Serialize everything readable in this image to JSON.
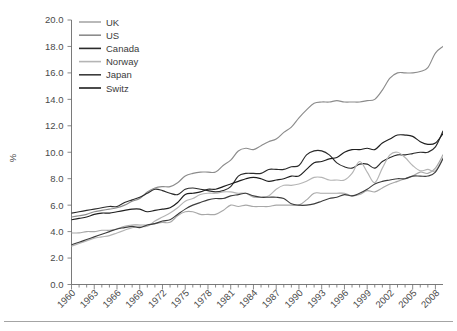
{
  "chart_data": {
    "type": "line",
    "title": "",
    "xlabel": "",
    "ylabel": "%",
    "ylim": [
      0.0,
      20.0
    ],
    "ytick_step": 2.0,
    "xlim": [
      1960,
      2009
    ],
    "grid": false,
    "legend_position": "top-left",
    "ytick_labels": [
      "0.0",
      "2.0",
      "4.0",
      "6.0",
      "8.0",
      "10.0",
      "12.0",
      "14.0",
      "16.0",
      "18.0",
      "20.0"
    ],
    "ytick_values": [
      0.0,
      2.0,
      4.0,
      6.0,
      8.0,
      10.0,
      12.0,
      14.0,
      16.0,
      18.0,
      20.0
    ],
    "xtick_labels": [
      "1960",
      "1963",
      "1966",
      "1969",
      "1972",
      "1975",
      "1978",
      "1981",
      "1984",
      "1987",
      "1990",
      "1993",
      "1996",
      "1999",
      "2002",
      "2005",
      "2008"
    ],
    "xtick_values": [
      1960,
      1963,
      1966,
      1969,
      1972,
      1975,
      1978,
      1981,
      1984,
      1987,
      1990,
      1993,
      1996,
      1999,
      2002,
      2005,
      2008
    ],
    "x": [
      1960,
      1961,
      1962,
      1963,
      1964,
      1965,
      1966,
      1967,
      1968,
      1969,
      1970,
      1971,
      1972,
      1973,
      1974,
      1975,
      1976,
      1977,
      1978,
      1979,
      1980,
      1981,
      1982,
      1983,
      1984,
      1985,
      1986,
      1987,
      1988,
      1989,
      1990,
      1991,
      1992,
      1993,
      1994,
      1995,
      1996,
      1997,
      1998,
      1999,
      2000,
      2001,
      2002,
      2003,
      2004,
      2005,
      2006,
      2007,
      2008,
      2009
    ],
    "series": [
      {
        "name": "UK",
        "color": "#a8a8a8",
        "values": [
          3.9,
          3.9,
          4.0,
          4.0,
          4.1,
          4.1,
          4.2,
          4.4,
          4.5,
          4.5,
          4.5,
          4.6,
          4.7,
          4.7,
          5.2,
          5.5,
          5.5,
          5.3,
          5.3,
          5.3,
          5.6,
          6.0,
          5.9,
          6.0,
          5.9,
          5.9,
          5.9,
          6.0,
          6.0,
          6.0,
          6.0,
          6.4,
          6.9,
          6.9,
          6.9,
          6.9,
          6.9,
          6.7,
          6.8,
          7.1,
          7.0,
          7.3,
          7.6,
          7.8,
          8.0,
          8.2,
          8.5,
          8.4,
          8.8,
          9.8
        ]
      },
      {
        "name": "US",
        "color": "#8c8c8c",
        "values": [
          5.1,
          5.2,
          5.3,
          5.5,
          5.6,
          5.7,
          5.8,
          6.0,
          6.3,
          6.5,
          7.0,
          7.3,
          7.4,
          7.4,
          7.7,
          8.2,
          8.4,
          8.5,
          8.5,
          8.5,
          9.0,
          9.4,
          10.1,
          10.3,
          10.2,
          10.5,
          10.8,
          11.0,
          11.5,
          11.9,
          12.6,
          13.2,
          13.7,
          13.8,
          13.8,
          13.9,
          13.8,
          13.8,
          13.8,
          13.9,
          14.0,
          14.7,
          15.6,
          16.0,
          16.0,
          16.0,
          16.1,
          16.4,
          17.5,
          18.0
        ]
      },
      {
        "name": "Canada",
        "color": "#2b2b2b",
        "values": [
          5.4,
          5.5,
          5.6,
          5.7,
          5.8,
          5.9,
          5.9,
          6.2,
          6.4,
          6.6,
          6.9,
          7.2,
          7.1,
          6.9,
          6.8,
          7.2,
          7.3,
          7.2,
          7.1,
          7.0,
          7.1,
          7.4,
          8.2,
          8.4,
          8.4,
          8.4,
          8.7,
          8.7,
          8.7,
          8.9,
          9.0,
          9.8,
          10.1,
          10.1,
          9.8,
          9.2,
          8.9,
          8.8,
          9.1,
          9.1,
          8.8,
          9.3,
          9.6,
          9.8,
          9.8,
          9.9,
          10.0,
          10.0,
          10.4,
          11.6
        ]
      },
      {
        "name": "Norway",
        "color": "#b5b5b5",
        "values": [
          2.9,
          3.1,
          3.3,
          3.5,
          3.6,
          3.7,
          3.9,
          4.1,
          4.3,
          4.4,
          4.4,
          4.8,
          5.1,
          5.4,
          5.8,
          6.3,
          6.5,
          6.8,
          6.9,
          6.9,
          7.0,
          7.0,
          6.9,
          6.9,
          6.6,
          6.6,
          6.7,
          7.2,
          7.5,
          7.5,
          7.6,
          7.8,
          8.1,
          8.1,
          7.9,
          7.9,
          7.9,
          8.4,
          9.3,
          8.5,
          7.7,
          8.8,
          9.8,
          10.0,
          9.6,
          9.0,
          8.6,
          8.7,
          8.6,
          9.6
        ]
      },
      {
        "name": "Japan",
        "color": "#3d3d3d",
        "values": [
          3.0,
          3.2,
          3.4,
          3.6,
          3.8,
          4.0,
          4.2,
          4.3,
          4.4,
          4.3,
          4.5,
          4.6,
          4.8,
          4.9,
          5.3,
          5.7,
          6.0,
          6.2,
          6.4,
          6.5,
          6.5,
          6.7,
          6.8,
          6.9,
          6.7,
          6.6,
          6.6,
          6.6,
          6.5,
          6.1,
          6.0,
          6.0,
          6.1,
          6.3,
          6.5,
          6.6,
          6.8,
          6.7,
          6.9,
          7.2,
          7.6,
          7.8,
          7.9,
          8.0,
          8.0,
          8.2,
          8.2,
          8.2,
          8.5,
          9.5
        ]
      },
      {
        "name": "Switz",
        "color": "#1f1f1f",
        "values": [
          4.9,
          5.0,
          5.1,
          5.3,
          5.4,
          5.4,
          5.5,
          5.6,
          5.7,
          5.7,
          5.5,
          5.6,
          5.7,
          5.8,
          6.2,
          6.8,
          6.9,
          7.0,
          7.2,
          7.2,
          7.4,
          7.6,
          7.8,
          8.0,
          8.1,
          8.0,
          7.8,
          7.9,
          8.0,
          8.2,
          8.2,
          8.7,
          9.2,
          9.3,
          9.5,
          9.6,
          10.0,
          10.2,
          10.2,
          10.3,
          10.2,
          10.7,
          11.0,
          11.3,
          11.3,
          11.2,
          10.8,
          10.6,
          10.7,
          11.4
        ]
      }
    ]
  },
  "legend": {
    "entries": [
      {
        "label": "UK"
      },
      {
        "label": "US"
      },
      {
        "label": "Canada"
      },
      {
        "label": "Norway"
      },
      {
        "label": "Japan"
      },
      {
        "label": "Switz"
      }
    ]
  }
}
